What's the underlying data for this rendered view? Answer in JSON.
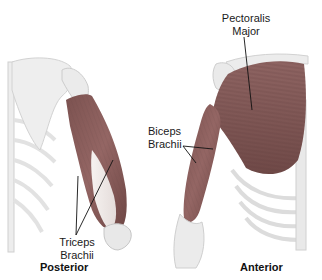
{
  "figure": {
    "views": [
      {
        "id": "posterior",
        "label": "Posterior",
        "muscles": [
          {
            "line1": "Triceps",
            "line2": "Brachii"
          }
        ]
      },
      {
        "id": "anterior",
        "label": "Anterior",
        "muscles": [
          {
            "line1": "Pectoralis",
            "line2": "Major"
          },
          {
            "line1": "Biceps",
            "line2": "Brachii"
          }
        ]
      }
    ],
    "colors": {
      "muscle": "#8c5e5c",
      "muscle_dark": "#6e4644",
      "muscle_light": "#b08886",
      "tendon": "#efe9e6",
      "bone": "#e6e6e6",
      "bone_edge": "#c9c9c9",
      "leader_line": "#111111",
      "background": "#ffffff"
    }
  }
}
